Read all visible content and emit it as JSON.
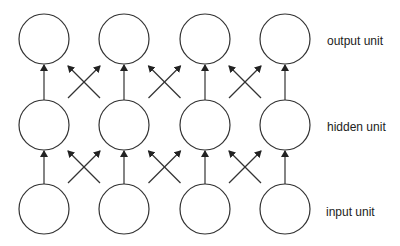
{
  "diagram": {
    "type": "neural-network-grid",
    "columns": 4,
    "layers": [
      {
        "id": "output",
        "label": "output unit",
        "cy": 39
      },
      {
        "id": "hidden",
        "label": "hidden unit",
        "cy": 125
      },
      {
        "id": "input",
        "label": "input unit",
        "cy": 209
      }
    ],
    "column_centers_x": [
      44,
      124,
      205,
      285
    ],
    "node_radius": 25,
    "stroke_color": "#333333",
    "connections": {
      "vertical": "each unit connects upward to the unit directly above",
      "cross": "each adjacent pair of columns has crossing diagonal arrows between layers"
    }
  },
  "labels": {
    "output": "output unit",
    "hidden": "hidden unit",
    "input": "input unit"
  }
}
